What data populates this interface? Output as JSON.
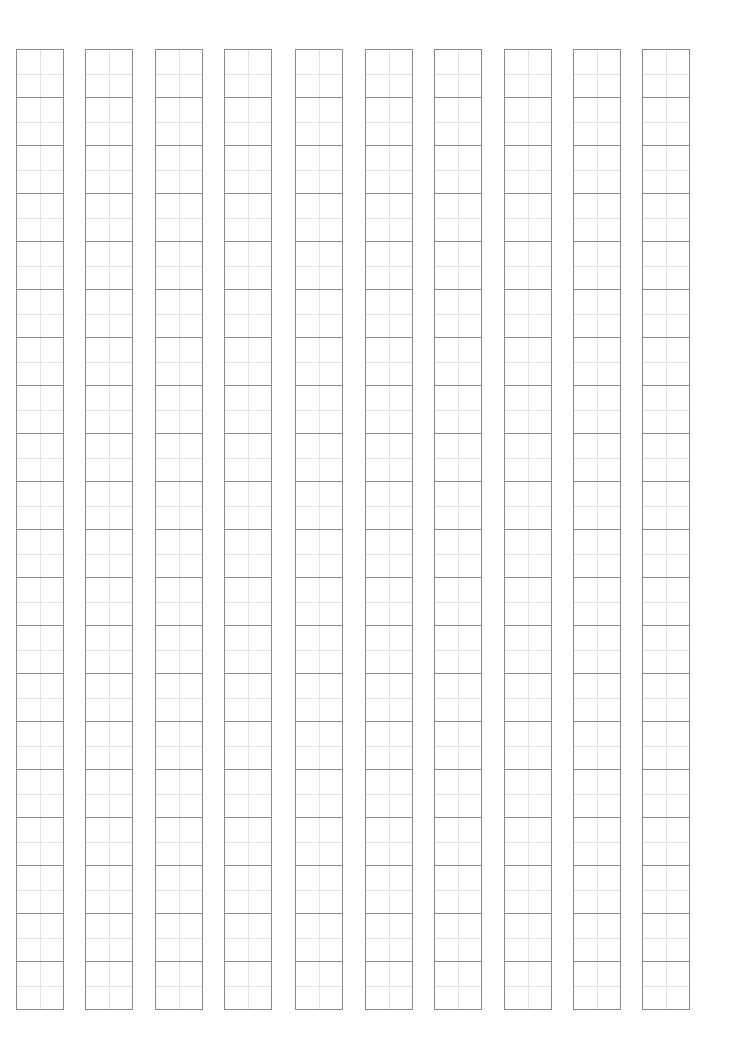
{
  "sheet": {
    "type": "tianzige-practice-grid",
    "columns": 10,
    "rows_per_column": 20,
    "column_left_offsets_px": [
      16,
      85,
      155,
      224,
      295,
      365,
      434,
      504,
      573,
      642
    ],
    "colors": {
      "cell_border": "#8a8a8a",
      "guide_line": "#e2e2e2",
      "background": "#ffffff"
    }
  }
}
